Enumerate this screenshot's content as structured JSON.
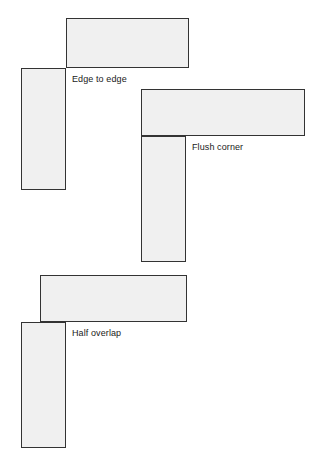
{
  "diagram": {
    "background_color": "#ffffff",
    "shape_fill_color": "#f0f0f0",
    "shape_stroke_color": "#333333",
    "label_color": "#1a1a1a",
    "groups": [
      {
        "id": "edge-to-edge",
        "label": "Edge to edge",
        "shapes": [
          {
            "name": "horizontal-bar",
            "x": 66,
            "y": 18,
            "width": 123,
            "height": 50
          },
          {
            "name": "vertical-bar",
            "x": 21,
            "y": 68,
            "width": 45,
            "height": 122
          }
        ]
      },
      {
        "id": "flush-corner",
        "label": "Flush corner",
        "shapes": [
          {
            "name": "horizontal-bar",
            "x": 141,
            "y": 89,
            "width": 164,
            "height": 47
          },
          {
            "name": "vertical-bar",
            "x": 141,
            "y": 136,
            "width": 45,
            "height": 126
          }
        ]
      },
      {
        "id": "half-overlap",
        "label": "Half overlap",
        "shapes": [
          {
            "name": "horizontal-bar",
            "x": 40,
            "y": 275,
            "width": 147,
            "height": 47
          },
          {
            "name": "vertical-bar",
            "x": 21,
            "y": 322,
            "width": 45,
            "height": 126
          }
        ]
      }
    ]
  }
}
